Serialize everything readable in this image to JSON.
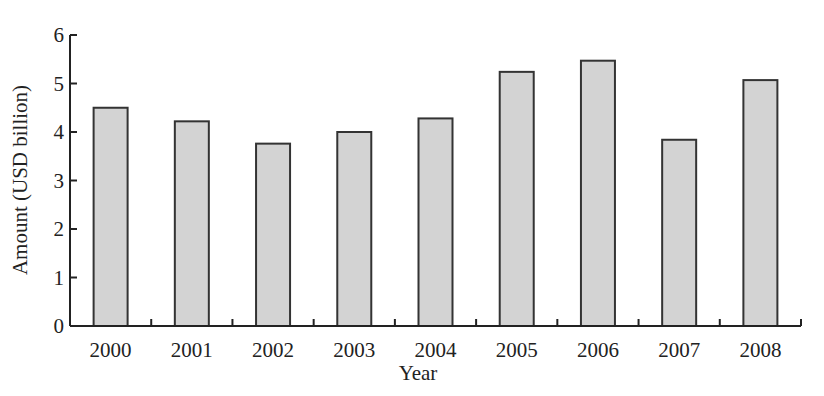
{
  "chart_data": {
    "type": "bar",
    "title": "",
    "xlabel": "Year",
    "ylabel": "Amount (USD billion)",
    "categories": [
      "2000",
      "2001",
      "2002",
      "2003",
      "2004",
      "2005",
      "2006",
      "2007",
      "2008"
    ],
    "values": [
      4.5,
      4.22,
      3.76,
      4.0,
      4.28,
      5.24,
      5.47,
      3.84,
      5.07
    ],
    "ylim": [
      0,
      6
    ],
    "yticks": [
      0,
      1,
      2,
      3,
      4,
      5,
      6
    ],
    "grid": false,
    "legend": null,
    "colors": {
      "bar_fill": "#d3d3d3",
      "bar_stroke": "#333333",
      "axis": "#222222"
    }
  }
}
